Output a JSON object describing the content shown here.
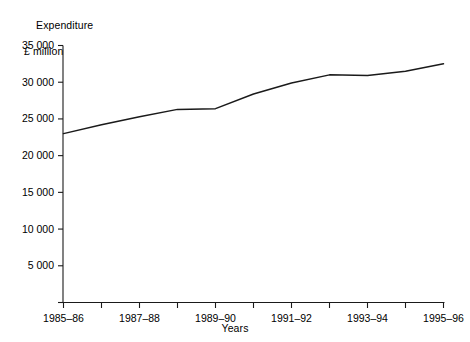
{
  "chart_data": {
    "type": "line",
    "title": "",
    "ylabel": "Expenditure\n£ million",
    "ylabel_line1": "Expenditure",
    "ylabel_line2": "£ million",
    "xlabel": "Years",
    "categories": [
      "1985–86",
      "1986–87",
      "1987–88",
      "1988–89",
      "1989–90",
      "1990–91",
      "1991–92",
      "1992–93",
      "1993–94",
      "1994–95",
      "1995–96"
    ],
    "x_tick_labels_visible": [
      "1985–86",
      "",
      "1987–88",
      "",
      "1989–90",
      "",
      "1991–92",
      "",
      "1993–94",
      "",
      "1995–96"
    ],
    "values": [
      23000,
      24200,
      25300,
      26300,
      26400,
      28400,
      29900,
      31000,
      30900,
      31500,
      32500
    ],
    "series": [
      {
        "name": "Expenditure",
        "values": [
          23000,
          24200,
          25300,
          26300,
          26400,
          28400,
          29900,
          31000,
          30900,
          31500,
          32500
        ]
      }
    ],
    "ylim": [
      0,
      35000
    ],
    "y_ticks": [
      0,
      5000,
      10000,
      15000,
      20000,
      25000,
      30000,
      35000
    ],
    "y_tick_labels": [
      "",
      "5 000",
      "10 000",
      "15 000",
      "20 000",
      "25 000",
      "30 000",
      "35 000"
    ],
    "grid": false,
    "legend": "none",
    "line_color": "#1a1a1a",
    "axis_color": "#1a1a1a"
  }
}
